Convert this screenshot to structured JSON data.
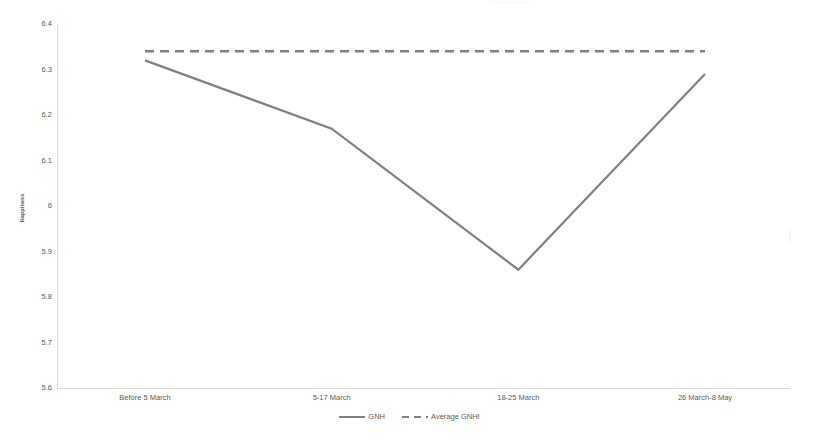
{
  "chart_data": {
    "type": "line",
    "title": "",
    "xlabel": "",
    "ylabel": "Happiness",
    "categories": [
      "Before 5 March",
      "5-17 March",
      "18-25 March",
      "26 March-8 May"
    ],
    "ylim": [
      5.6,
      6.4
    ],
    "ytick_labels": [
      "6.4",
      "6.3",
      "6.2",
      "6.1",
      "6",
      "5.9",
      "5.8",
      "5.7",
      "5.6"
    ],
    "ytick_values": [
      6.4,
      6.3,
      6.2,
      6.1,
      6.0,
      5.9,
      5.8,
      5.7,
      5.6
    ],
    "grid": false,
    "legend_position": "bottom-center",
    "series": [
      {
        "name": "GNH",
        "style": "solid",
        "color": "#808080",
        "values": [
          6.32,
          6.17,
          5.86,
          6.29
        ]
      },
      {
        "name": "Average GNHI",
        "style": "dashed",
        "color": "#808080",
        "values": [
          6.34,
          6.34,
          6.34,
          6.34
        ]
      }
    ]
  },
  "axes": {
    "y_title": "Happiness"
  },
  "legend": {
    "items": [
      {
        "label": "GNH",
        "style": "solid"
      },
      {
        "label": "Average GNHI",
        "style": "dashed"
      }
    ]
  }
}
